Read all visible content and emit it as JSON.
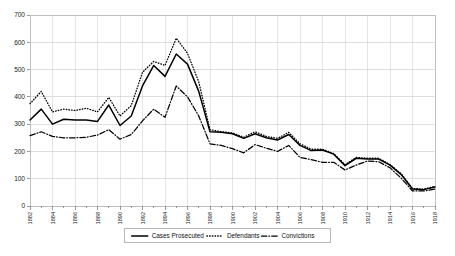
{
  "chart_data": {
    "type": "line",
    "title": "",
    "xlabel": "",
    "ylabel": "",
    "ylim": [
      0,
      700
    ],
    "xlim": [
      1882,
      1918
    ],
    "ytick_labels": [
      "0",
      "100",
      "200",
      "300",
      "400",
      "500",
      "600",
      "700"
    ],
    "ytick_values": [
      0,
      100,
      200,
      300,
      400,
      500,
      600,
      700
    ],
    "grid": true,
    "legend_position": "bottom",
    "x": [
      1882,
      1883,
      1884,
      1885,
      1886,
      1887,
      1888,
      1889,
      1890,
      1891,
      1892,
      1893,
      1894,
      1895,
      1896,
      1897,
      1898,
      1899,
      1900,
      1901,
      1902,
      1903,
      1904,
      1905,
      1906,
      1907,
      1908,
      1909,
      1910,
      1911,
      1912,
      1913,
      1914,
      1915,
      1916,
      1917,
      1918
    ],
    "xtick_labels": [
      "1882",
      "1884",
      "1886",
      "1888",
      "1890",
      "1892",
      "1894",
      "1896",
      "1898",
      "1900",
      "1902",
      "1904",
      "1906",
      "1908",
      "1910",
      "1912",
      "1914",
      "1916",
      "1918"
    ],
    "series": [
      {
        "name": "Cases Prosecuted",
        "style": "solid",
        "values": [
          315,
          355,
          300,
          318,
          315,
          315,
          310,
          370,
          295,
          330,
          440,
          515,
          475,
          557,
          520,
          420,
          272,
          270,
          265,
          248,
          265,
          250,
          242,
          262,
          222,
          203,
          205,
          190,
          148,
          175,
          172,
          172,
          150,
          115,
          62,
          60,
          70
        ]
      },
      {
        "name": "Defendants",
        "style": "dotted",
        "values": [
          375,
          420,
          345,
          355,
          350,
          358,
          345,
          398,
          330,
          368,
          490,
          530,
          515,
          615,
          560,
          455,
          280,
          272,
          268,
          252,
          272,
          255,
          248,
          270,
          228,
          208,
          208,
          192,
          152,
          178,
          175,
          175,
          152,
          118,
          64,
          62,
          72
        ]
      },
      {
        "name": "Convictions",
        "style": "dashdot",
        "values": [
          258,
          272,
          255,
          250,
          250,
          252,
          260,
          280,
          245,
          262,
          312,
          355,
          325,
          440,
          400,
          330,
          228,
          222,
          210,
          195,
          225,
          212,
          200,
          222,
          178,
          170,
          160,
          160,
          132,
          150,
          165,
          162,
          140,
          102,
          55,
          55,
          62
        ]
      }
    ]
  },
  "legend": {
    "items": [
      {
        "label": "Cases Prosecuted",
        "marker": "solid-line"
      },
      {
        "label": "Defendants",
        "marker": "dotted-line"
      },
      {
        "label": "Convictions",
        "marker": "dashdot-line"
      }
    ]
  }
}
